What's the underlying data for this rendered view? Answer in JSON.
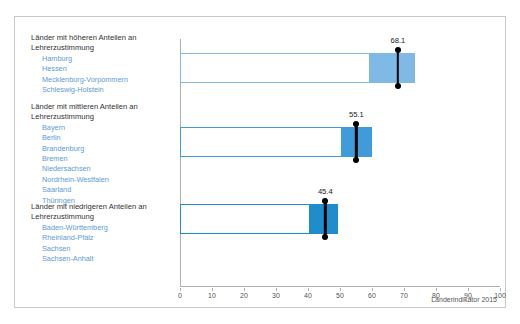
{
  "figure": {
    "cut_off_header": "",
    "source_note": "Länderindikator 2015"
  },
  "groups": [
    {
      "title": "Länder mit höheren Anteilen an\nLehrerzustimmung",
      "states": [
        "Hamburg",
        "Hessen",
        "Mecklenburg-Vorpommern",
        "Schleswig-Holstein"
      ]
    },
    {
      "title": "Länder mit mittleren Anteilen an\nLehrerzustimmung",
      "states": [
        "Bayern",
        "Berlin",
        "Brandenburg",
        "Bremen",
        "Niedersachsen",
        "Nordrhein-Westfalen",
        "Saarland",
        "Thüringen"
      ]
    },
    {
      "title": "Länder mit niedrigeren Anteilen an\nLehrerzustimmung",
      "states": [
        "Baden-Württemberg",
        "Rheinland-Pfalz",
        "Sachsen",
        "Sachsen-Anhalt"
      ]
    }
  ],
  "chart_data": {
    "type": "bar",
    "title": "",
    "xlabel": "",
    "ylabel": "",
    "xlim": [
      0,
      100
    ],
    "xticks": [
      0,
      10,
      20,
      30,
      40,
      50,
      60,
      70,
      80,
      90,
      100
    ],
    "grid": false,
    "legend": "none",
    "orientation": "horizontal",
    "categories": [
      "Länder mit höheren Anteilen an Lehrerzustimmung",
      "Länder mit mittleren Anteilen an Lehrerzustimmung",
      "Länder mit niedrigeren Anteilen an Lehrerzustimmung"
    ],
    "values": [
      68.1,
      55.1,
      45.4
    ],
    "data_labels": [
      "68.1",
      "55.1",
      "45.4"
    ],
    "bars": [
      {
        "label": "68.1",
        "value": 68.1,
        "bar_end": 73.5,
        "fill_start": 59.5,
        "fill_color": "#7fb9e6",
        "outline_color": "#7fb9e6"
      },
      {
        "label": "55.1",
        "value": 55.1,
        "bar_end": 60.0,
        "fill_start": 50.5,
        "fill_color": "#3f9bd9",
        "outline_color": "#3f9bd9"
      },
      {
        "label": "45.4",
        "value": 45.4,
        "bar_end": 49.5,
        "fill_start": 40.5,
        "fill_color": "#1f8ccc",
        "outline_color": "#1f8ccc"
      }
    ]
  },
  "ticks": [
    "0",
    "10",
    "20",
    "30",
    "40",
    "50",
    "60",
    "70",
    "80",
    "90",
    "100"
  ],
  "colors": {
    "state_text": "#5b9bd5",
    "title_text": "#333333",
    "axis": "#b0b0b0",
    "marker": "#000000",
    "frame": "#c8c8c8"
  }
}
